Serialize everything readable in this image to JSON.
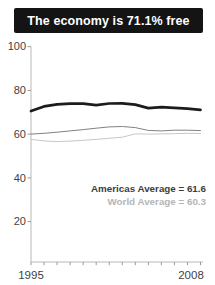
{
  "title": "The economy is 71.1% free",
  "legend": {
    "americas": "Americas Average = 61.6",
    "world": "World Average = 60.3"
  },
  "colors": {
    "title_bg": "#141414",
    "title_text": "#ffffff",
    "axis": "#b9b9b9",
    "tick": "#9a9a9a",
    "tick_label": "#3f3f3f",
    "country_line": "#1c1c1c",
    "americas_line": "#828282",
    "world_line": "#c7c7c7",
    "legend_americas": "#3d3d3d",
    "legend_world": "#b5b5b5"
  },
  "chart_data": {
    "type": "line",
    "title": "The economy is 71.1% free",
    "x": [
      1995,
      1996,
      1997,
      1998,
      1999,
      2000,
      2001,
      2002,
      2003,
      2004,
      2005,
      2006,
      2007,
      2008
    ],
    "x_tick_labels": [
      "1995",
      "2008"
    ],
    "y_ticks": [
      20,
      40,
      60,
      80,
      100
    ],
    "ylim": [
      0,
      100
    ],
    "xlabel": "",
    "ylabel": "",
    "grid": false,
    "legend_position": "inside-right",
    "series": [
      {
        "name": "Economic freedom score",
        "color": "#1c1c1c",
        "width": 2.7,
        "values": [
          70.6,
          72.7,
          73.6,
          73.9,
          73.9,
          73.3,
          74.0,
          74.1,
          73.5,
          71.9,
          72.3,
          72.0,
          71.7,
          71.1
        ]
      },
      {
        "name": "Americas Average",
        "color": "#828282",
        "width": 1,
        "values": [
          60.0,
          60.4,
          60.9,
          61.5,
          62.1,
          62.7,
          63.3,
          63.5,
          63.0,
          61.7,
          61.5,
          61.8,
          61.8,
          61.6
        ]
      },
      {
        "name": "World Average",
        "color": "#c7c7c7",
        "width": 1,
        "values": [
          57.6,
          56.9,
          56.6,
          56.8,
          57.2,
          57.6,
          58.1,
          58.6,
          60.1,
          60.0,
          60.1,
          60.2,
          60.4,
          60.3
        ]
      }
    ]
  }
}
